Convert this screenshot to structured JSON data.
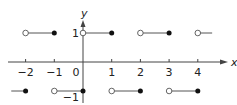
{
  "chart_data": {
    "type": "line",
    "title": "",
    "xlabel": "x",
    "ylabel": "y",
    "xlim": [
      -2.5,
      4.5
    ],
    "ylim": [
      -1,
      1
    ],
    "grid": false,
    "x_ticks": [
      -2,
      -1,
      0,
      1,
      2,
      3,
      4
    ],
    "x_tick_labels": [
      "−2",
      "−1",
      "0",
      "1",
      "2",
      "3",
      "4"
    ],
    "y_tick_labels": [
      {
        "value": 1,
        "label": "1"
      },
      {
        "value": -1,
        "label": "−1"
      }
    ],
    "segments": [
      {
        "x_start": -2,
        "x_end": -1,
        "y": 1,
        "start": "open",
        "end": "closed"
      },
      {
        "x_start": 0,
        "x_end": 1,
        "y": 1,
        "start": "open",
        "end": "closed"
      },
      {
        "x_start": 2,
        "x_end": 3,
        "y": 1,
        "start": "open",
        "end": "closed"
      },
      {
        "x_start": 4,
        "x_end": 4.5,
        "y": 1,
        "start": "open",
        "end": "none"
      },
      {
        "x_start": -2.5,
        "x_end": -2,
        "y": -1,
        "start": "none",
        "end": "closed"
      },
      {
        "x_start": -1,
        "x_end": 0,
        "y": -1,
        "start": "open",
        "end": "closed"
      },
      {
        "x_start": 1,
        "x_end": 2,
        "y": -1,
        "start": "open",
        "end": "closed"
      },
      {
        "x_start": 3,
        "x_end": 4,
        "y": -1,
        "start": "open",
        "end": "closed"
      }
    ]
  },
  "colors": {
    "axis": "#444444",
    "line": "#555555",
    "dot": "#111111",
    "open_fill": "#ffffff"
  }
}
